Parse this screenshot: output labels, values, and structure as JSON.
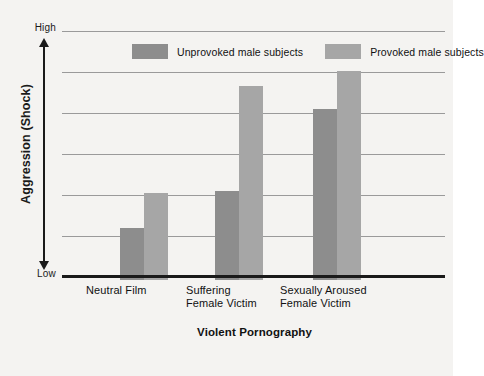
{
  "chart_data": {
    "type": "bar",
    "title": "",
    "xlabel": "Violent Pornography",
    "ylabel": "Aggression (Shock)",
    "categories": [
      "Neutral Film",
      "Suffering Female Victim",
      "Sexually Aroused Female Victim"
    ],
    "category_lines": [
      [
        "Neutral Film"
      ],
      [
        "Suffering",
        "Female Victim"
      ],
      [
        "Sexually Aroused",
        "Female Victim"
      ]
    ],
    "series": [
      {
        "name": "Unprovoked male subjects",
        "color": "#8d8d8d",
        "values": [
          20.5,
          35.5,
          68
        ]
      },
      {
        "name": "Provoked male subjects",
        "color": "#a6a6a6",
        "values": [
          34.5,
          77,
          83
        ]
      }
    ],
    "ylim": [
      0,
      100
    ],
    "y_tick_labels": [
      "High",
      "Low"
    ],
    "y_axis_low_label": "Low",
    "y_axis_high_label": "High",
    "grid": true,
    "gridline_count": 6,
    "legend_position": "top-center",
    "background_color": "#f4f3f1",
    "baseline_color": "#1a1a1a",
    "gridline_color": "#9a9a9a"
  },
  "legend": {
    "entries": [
      {
        "label": "Unprovoked male subjects"
      },
      {
        "label": "Provoked male subjects"
      }
    ]
  },
  "axes": {
    "y_high": "High",
    "y_low": "Low",
    "y_title": "Aggression (Shock)",
    "x_title": "Violent Pornography"
  }
}
